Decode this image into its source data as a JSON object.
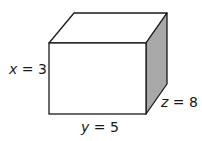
{
  "diagram": {
    "type": "rectangular-prism",
    "colors": {
      "edge": "#1a1a1a",
      "front_face": "#ffffff",
      "top_face": "#ffffff",
      "side_face": "#a8a8a8"
    },
    "labels": {
      "height": {
        "var": "x",
        "eq": " = ",
        "value": "3"
      },
      "width": {
        "var": "y",
        "eq": " = ",
        "value": "5"
      },
      "depth": {
        "var": "z",
        "eq": " = ",
        "value": "8"
      }
    }
  }
}
